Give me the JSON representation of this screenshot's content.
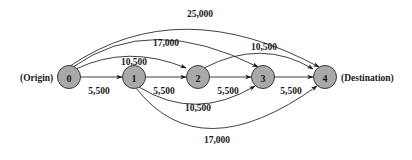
{
  "diagram": {
    "type": "directed-network",
    "colors": {
      "node_fill": "#a9a9a9",
      "node_stroke": "#3a3a3a",
      "edge": "#2a2a2a",
      "text": "#1a1a1a",
      "background": "#ffffff"
    },
    "origin_label": "(Origin)",
    "destination_label": "(Destination)",
    "nodes": [
      {
        "id": "0",
        "label": "0",
        "x": 69,
        "y": 77
      },
      {
        "id": "1",
        "label": "1",
        "x": 134,
        "y": 77
      },
      {
        "id": "2",
        "label": "2",
        "x": 198,
        "y": 77
      },
      {
        "id": "3",
        "label": "3",
        "x": 263,
        "y": 77
      },
      {
        "id": "4",
        "label": "4",
        "x": 325,
        "y": 77
      }
    ],
    "edges": [
      {
        "from": "0",
        "to": "1",
        "label": "5,500",
        "position": "straight"
      },
      {
        "from": "1",
        "to": "2",
        "label": "5,500",
        "position": "straight"
      },
      {
        "from": "2",
        "to": "3",
        "label": "5,500",
        "position": "straight"
      },
      {
        "from": "3",
        "to": "4",
        "label": "5,500",
        "position": "straight"
      },
      {
        "from": "0",
        "to": "2",
        "label": "10,500",
        "position": "arc-above"
      },
      {
        "from": "0",
        "to": "3",
        "label": "17,000",
        "position": "arc-above"
      },
      {
        "from": "0",
        "to": "4",
        "label": "25,000",
        "position": "arc-above"
      },
      {
        "from": "2",
        "to": "4",
        "label": "10,500",
        "position": "arc-above"
      },
      {
        "from": "1",
        "to": "3",
        "label": "10,500",
        "position": "arc-below"
      },
      {
        "from": "1",
        "to": "4",
        "label": "17,000",
        "position": "arc-below"
      }
    ]
  }
}
